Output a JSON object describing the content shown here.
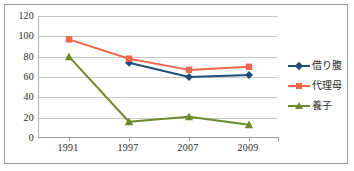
{
  "chart_data": {
    "type": "line",
    "title": "",
    "xlabel": "",
    "ylabel": "",
    "categories": [
      "1991",
      "1997",
      "2007",
      "2009"
    ],
    "ylim": [
      0,
      120
    ],
    "yticks": [
      0,
      20,
      40,
      60,
      80,
      100,
      120
    ],
    "ytick_labels": [
      "0",
      "20",
      "40",
      "60",
      "80",
      "100",
      "120"
    ],
    "grid": true,
    "legend_position": "right",
    "series": [
      {
        "name": "借り腹",
        "color": "#1f4e79",
        "marker": "diamond",
        "values": [
          null,
          74,
          60,
          62
        ]
      },
      {
        "name": "代理母",
        "color": "#f4664a",
        "marker": "square",
        "values": [
          97,
          78,
          67,
          70
        ]
      },
      {
        "name": "養子",
        "color": "#6e8b2a",
        "marker": "triangle",
        "values": [
          80,
          16,
          21,
          13
        ]
      }
    ]
  },
  "legend": {
    "items": [
      {
        "label": "借り腹",
        "color": "#1f4e79",
        "marker": "diamond"
      },
      {
        "label": "代理母",
        "color": "#f4664a",
        "marker": "square"
      },
      {
        "label": "養子",
        "color": "#6e8b2a",
        "marker": "triangle"
      }
    ]
  },
  "colors": {
    "gridline": "#c8c8c8",
    "axis": "#9a9a9a",
    "frame": "#9a9a9a",
    "text": "#2a2a2a",
    "background": "#ffffff"
  }
}
